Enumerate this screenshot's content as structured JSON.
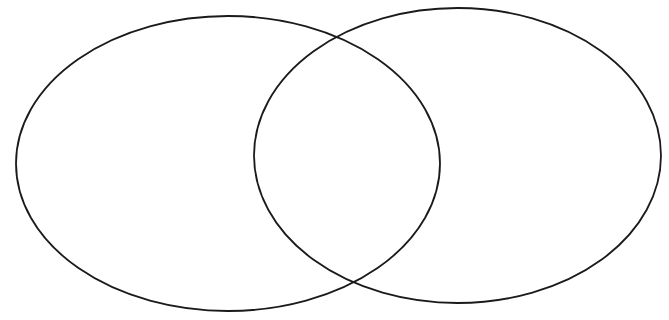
{
  "diagram": {
    "type": "venn",
    "background": "#ffffff",
    "stroke_color": "#1a1a1a",
    "sets": [
      {
        "id": "left",
        "label": "",
        "cx": 228,
        "cy": 163.5,
        "rx": 212,
        "ry": 147.5
      },
      {
        "id": "right",
        "label": "",
        "cx": 457.5,
        "cy": 155.5,
        "rx": 203.5,
        "ry": 147.5
      }
    ],
    "regions": {
      "left_only": "",
      "intersection": "",
      "right_only": ""
    }
  }
}
